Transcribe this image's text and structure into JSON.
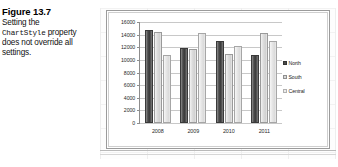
{
  "caption": {
    "title": "Figure 13.7",
    "line1": "Setting the",
    "code_term": "ChartStyle",
    "line2_tail": " property",
    "line3": "does not override all",
    "line4": "settings."
  },
  "chart_data": {
    "type": "bar",
    "title": "",
    "xlabel": "",
    "ylabel": "",
    "categories": [
      "2008",
      "2009",
      "2010",
      "2011"
    ],
    "series": [
      {
        "name": "North",
        "values": [
          14800,
          11900,
          13000,
          10700
        ]
      },
      {
        "name": "South",
        "values": [
          14400,
          11800,
          10900,
          14200
        ]
      },
      {
        "name": "Central",
        "values": [
          10700,
          14200,
          12200,
          13000
        ]
      }
    ],
    "ylim": [
      0,
      16000
    ],
    "y_ticks": [
      16000,
      14000,
      12000,
      10000,
      8000,
      6000,
      4000,
      2000,
      0
    ],
    "y_tick_labels": [
      "16000",
      "14000",
      "12000",
      "10000",
      "8000",
      "6000",
      "4000",
      "2000",
      "0"
    ],
    "grid": true,
    "legend_position": "right",
    "legend_entries": [
      "North",
      "South",
      "Central"
    ],
    "colors": {
      "north": "#4a4a4a",
      "south": "#d9d9d9",
      "central": "#ededed",
      "gridline": "#c8c8c8",
      "axis": "#8d8d8d"
    }
  }
}
